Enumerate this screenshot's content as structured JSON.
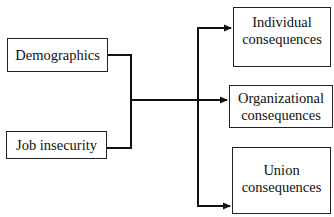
{
  "diagram": {
    "inputs": [
      {
        "id": "demographics",
        "label": "Demographics"
      },
      {
        "id": "job_insecurity",
        "label": "Job insecurity"
      }
    ],
    "outputs": [
      {
        "id": "individual",
        "line1": "Individual",
        "line2": "consequences"
      },
      {
        "id": "organizational",
        "line1": "Organizational",
        "line2": "consequences"
      },
      {
        "id": "union",
        "line1": "Union",
        "line2": "consequences"
      }
    ],
    "edges": [
      {
        "from": [
          "demographics",
          "job_insecurity"
        ],
        "to": "individual"
      },
      {
        "from": [
          "demographics",
          "job_insecurity"
        ],
        "to": "organizational"
      },
      {
        "from": [
          "demographics",
          "job_insecurity"
        ],
        "to": "union"
      }
    ],
    "colors": {
      "line": "#111111",
      "border": "#222222",
      "background": "#ffffff"
    }
  }
}
